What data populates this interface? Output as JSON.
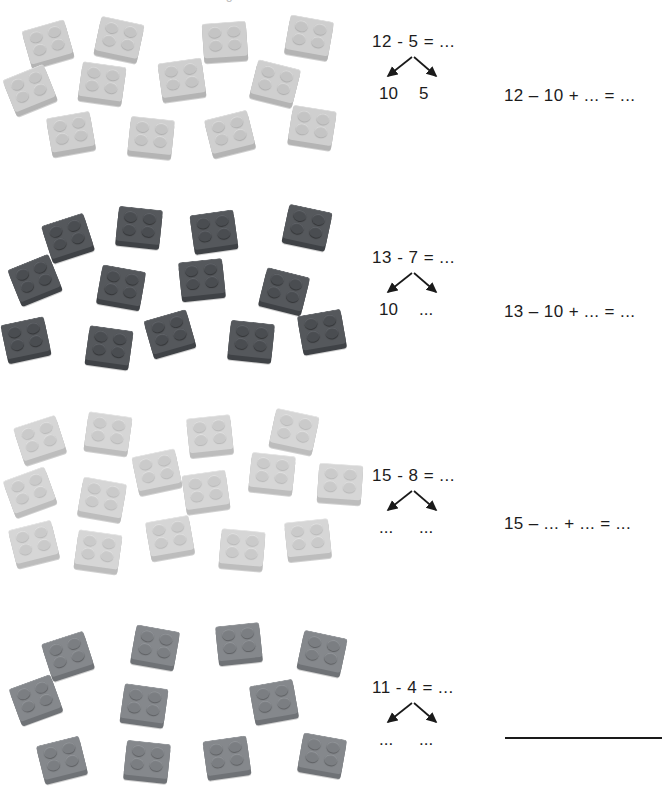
{
  "page": {
    "header_fragment": "Bricks subtraction worksheet — crossing the ten",
    "background": "#ffffff",
    "width": 669,
    "height": 799
  },
  "palette": {
    "light_gray": "#cfcfcf",
    "pale_gray": "#d6d6d6",
    "dark_gray": "#55585c",
    "mid_gray": "#85888c",
    "ink": "#1a1a1a"
  },
  "exercises": [
    {
      "id": "exercise-1",
      "brick_count": 12,
      "brick_color": "light_gray",
      "equation_top": "12 - 5 = ...",
      "leaf_left": "10",
      "leaf_right": "5",
      "equation_right": "12 – 10 + ... = ...",
      "has_answer_rule": false
    },
    {
      "id": "exercise-2",
      "brick_count": 13,
      "brick_color": "dark_gray",
      "equation_top": "13 - 7 = ...",
      "leaf_left": "10",
      "leaf_right": "...",
      "equation_right": "13 – 10 + ... = ...",
      "has_answer_rule": false
    },
    {
      "id": "exercise-3",
      "brick_count": 15,
      "brick_color": "pale_gray",
      "equation_top": "15 - 8 = ...",
      "leaf_left": "...",
      "leaf_right": "...",
      "equation_right": "15 – ... + ... = ...",
      "has_answer_rule": false
    },
    {
      "id": "exercise-4",
      "brick_count": 11,
      "brick_color": "mid_gray",
      "equation_top": "11 - 4 = ...",
      "leaf_left": "...",
      "leaf_right": "...",
      "equation_right": "",
      "has_answer_rule": true
    }
  ],
  "brick_layout": {
    "exercise-1": [
      {
        "x": 26,
        "y": 22,
        "r": -16
      },
      {
        "x": 97,
        "y": 18,
        "r": 12
      },
      {
        "x": 203,
        "y": 20,
        "r": -4
      },
      {
        "x": 287,
        "y": 16,
        "r": 10
      },
      {
        "x": 8,
        "y": 68,
        "r": -22
      },
      {
        "x": 80,
        "y": 62,
        "r": 8
      },
      {
        "x": 160,
        "y": 58,
        "r": -8
      },
      {
        "x": 253,
        "y": 62,
        "r": 14
      },
      {
        "x": 49,
        "y": 112,
        "r": -10
      },
      {
        "x": 129,
        "y": 116,
        "r": 6
      },
      {
        "x": 208,
        "y": 112,
        "r": -14
      },
      {
        "x": 290,
        "y": 106,
        "r": 9
      }
    ],
    "exercise-2": [
      {
        "x": 46,
        "y": 216,
        "r": -18
      },
      {
        "x": 117,
        "y": 206,
        "r": 6
      },
      {
        "x": 192,
        "y": 210,
        "r": -8
      },
      {
        "x": 285,
        "y": 206,
        "r": 12
      },
      {
        "x": 13,
        "y": 258,
        "r": -22
      },
      {
        "x": 99,
        "y": 266,
        "r": 10
      },
      {
        "x": 180,
        "y": 258,
        "r": -6
      },
      {
        "x": 262,
        "y": 270,
        "r": 14
      },
      {
        "x": 4,
        "y": 318,
        "r": -12
      },
      {
        "x": 87,
        "y": 326,
        "r": 8
      },
      {
        "x": 148,
        "y": 312,
        "r": -16
      },
      {
        "x": 229,
        "y": 320,
        "r": 6
      },
      {
        "x": 300,
        "y": 310,
        "r": -10
      }
    ],
    "exercise-3": [
      {
        "x": 18,
        "y": 418,
        "r": -18
      },
      {
        "x": 86,
        "y": 412,
        "r": 8
      },
      {
        "x": 188,
        "y": 414,
        "r": -6
      },
      {
        "x": 272,
        "y": 410,
        "r": 12
      },
      {
        "x": 135,
        "y": 450,
        "r": -12
      },
      {
        "x": 250,
        "y": 452,
        "r": 6
      },
      {
        "x": 8,
        "y": 470,
        "r": -20
      },
      {
        "x": 80,
        "y": 478,
        "r": 10
      },
      {
        "x": 184,
        "y": 470,
        "r": -8
      },
      {
        "x": 318,
        "y": 462,
        "r": 4
      },
      {
        "x": 12,
        "y": 522,
        "r": -14
      },
      {
        "x": 76,
        "y": 530,
        "r": 8
      },
      {
        "x": 148,
        "y": 516,
        "r": -10
      },
      {
        "x": 220,
        "y": 528,
        "r": 5
      },
      {
        "x": 286,
        "y": 518,
        "r": -6
      }
    ],
    "exercise-4": [
      {
        "x": 46,
        "y": 634,
        "r": -18
      },
      {
        "x": 133,
        "y": 626,
        "r": 10
      },
      {
        "x": 217,
        "y": 622,
        "r": -6
      },
      {
        "x": 300,
        "y": 632,
        "r": 12
      },
      {
        "x": 14,
        "y": 678,
        "r": -20
      },
      {
        "x": 122,
        "y": 684,
        "r": 8
      },
      {
        "x": 252,
        "y": 680,
        "r": -10
      },
      {
        "x": 40,
        "y": 738,
        "r": -14
      },
      {
        "x": 125,
        "y": 740,
        "r": 6
      },
      {
        "x": 205,
        "y": 736,
        "r": -8
      },
      {
        "x": 300,
        "y": 734,
        "r": 10
      }
    ]
  }
}
